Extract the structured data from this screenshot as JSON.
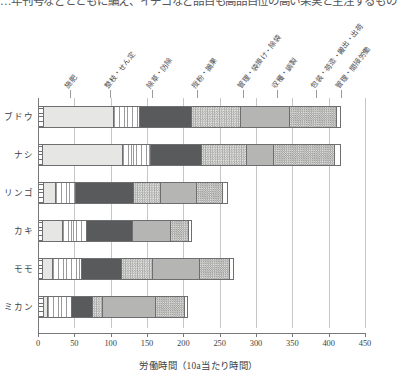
{
  "page": {
    "top_text": "…年刊号などとともに編え、イチゴなど品目も高品目位の高い果実と主注するもの"
  },
  "axis": {
    "x_title": "労働時間（10a当たり時間）",
    "x_ticks": [
      0,
      50,
      100,
      150,
      200,
      250,
      300,
      350,
      400,
      450
    ],
    "x_min": 0,
    "x_max": 450
  },
  "chart_data": {
    "type": "bar",
    "orientation": "horizontal",
    "stacked": true,
    "title": "",
    "xlabel": "労働時間（10a当たり時間）",
    "ylabel": "",
    "xlim": [
      0,
      450
    ],
    "grid": true,
    "legend_position": "top-rotated",
    "categories": [
      "ブドウ",
      "ナシ",
      "リンゴ",
      "カキ",
      "モモ",
      "ミカン"
    ],
    "series": [
      {
        "name": "施肥",
        "pattern": "horizontal-hatch",
        "color": "#6f6f72",
        "values": [
          7,
          6,
          7,
          6,
          6,
          7
        ]
      },
      {
        "name": "整枝・せん定",
        "pattern": "light-solid",
        "color": "#e6e6e4",
        "values": [
          96,
          110,
          17,
          27,
          13,
          6
        ]
      },
      {
        "name": "除草・防除",
        "pattern": "vertical-hatch",
        "color": "#9a9a9c",
        "values": [
          36,
          38,
          27,
          33,
          40,
          32
        ]
      },
      {
        "name": "授粉・摘果",
        "pattern": "dark-solid",
        "color": "#585a5c",
        "values": [
          72,
          70,
          80,
          63,
          55,
          29
        ]
      },
      {
        "name": "管理・袋掛け・除袋",
        "pattern": "checker-light",
        "color": "#cfd0ce",
        "values": [
          67,
          62,
          37,
          0,
          43,
          14
        ]
      },
      {
        "name": "収穫・調製",
        "pattern": "mid-solid",
        "color": "#b5b6b4",
        "values": [
          67,
          37,
          50,
          53,
          65,
          73
        ]
      },
      {
        "name": "包装・荷造・搬出・出荷",
        "pattern": "checker-dense",
        "color": "#c9cac8",
        "values": [
          65,
          84,
          35,
          24,
          41,
          40
        ]
      },
      {
        "name": "管理・間接労働",
        "pattern": "white",
        "color": "#ffffff",
        "values": [
          7,
          10,
          8,
          6,
          7,
          6
        ]
      }
    ],
    "totals": [
      417,
      417,
      261,
      212,
      270,
      207
    ]
  }
}
